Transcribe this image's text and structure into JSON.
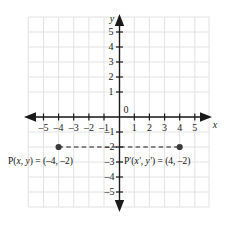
{
  "figure": {
    "axis_labels": {
      "x": "x",
      "y": "y"
    },
    "origin_label": "0",
    "colors": {
      "grid": "#e2e2e2",
      "grid_border": "#d5d5d5",
      "axis": "#1a1a1a",
      "point": "#3a3a3a",
      "dashed": "#1a1a1a",
      "text": "#1a1a1a",
      "background": "#ffffff"
    },
    "x_axis": {
      "min": -5,
      "max": 5,
      "ticks": [
        -5,
        -4,
        -3,
        -2,
        -1,
        1,
        2,
        3,
        4,
        5
      ],
      "tick_labels": [
        "–5",
        "–4",
        "–3",
        "–2",
        "–1",
        "1",
        "2",
        "3",
        "4",
        "5"
      ],
      "arrows": [
        "left",
        "right"
      ]
    },
    "y_axis": {
      "min": -5,
      "max": 5,
      "ticks": [
        5,
        4,
        3,
        2,
        1,
        -1,
        -2,
        -3,
        -4,
        -5
      ],
      "tick_labels": [
        "5",
        "4",
        "3",
        "2",
        "1",
        "–1",
        "–2",
        "–3",
        "–4",
        "–5"
      ],
      "arrows": [
        "up",
        "down"
      ]
    },
    "grid": {
      "visible": true,
      "spacing_units": 1
    },
    "points": [
      {
        "name": "P",
        "x": -4,
        "y": -2,
        "label_prefix": "P(",
        "label_vars": "x, y",
        "label_middle": ") = (",
        "label_coords": "–4, –2",
        "label_suffix": ")"
      },
      {
        "name": "P'",
        "x": 4,
        "y": -2,
        "label_prefix": "P′(",
        "label_vars": "x′, y′",
        "label_middle": ") = (",
        "label_coords": "4, –2",
        "label_suffix": ")"
      }
    ],
    "connector": {
      "style": "dashed",
      "from_x": -4,
      "to_x": 4,
      "y": -2
    }
  }
}
